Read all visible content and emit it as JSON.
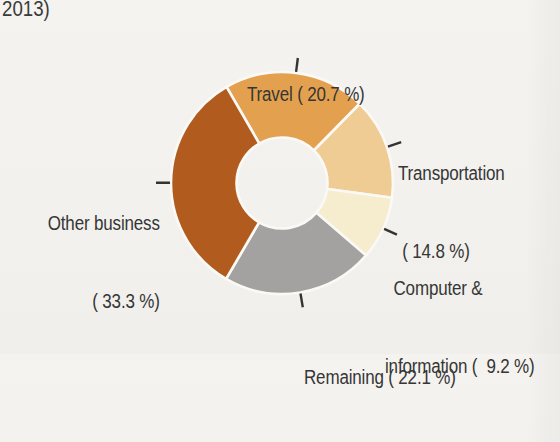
{
  "caption_fragment": "2013)",
  "palette": {
    "paper": "#f2f1ed",
    "text": "#363636",
    "separator": "#faf9f5",
    "tick": "#333333"
  },
  "chart_data": {
    "type": "pie",
    "subtype": "donut",
    "title": "",
    "unit": "%",
    "start_angle_deg": -30,
    "direction": "clockwise",
    "legend": "none",
    "separator_color": "#faf9f5",
    "tick_color": "#333333",
    "slices": [
      {
        "name": "Travel",
        "value": 20.7,
        "color": "#e3a14f",
        "label_lines": [
          "Travel ( 20.7 %)"
        ]
      },
      {
        "name": "Transportation",
        "value": 14.8,
        "color": "#f0cc95",
        "label_lines": [
          "Transportation",
          "( 14.8 %)"
        ]
      },
      {
        "name": "Computer & information",
        "value": 9.2,
        "color": "#f6ecce",
        "label_lines": [
          "Computer &",
          "information (  9.2 %)"
        ]
      },
      {
        "name": "Remaining",
        "value": 22.1,
        "color": "#a3a2a0",
        "label_lines": [
          "Remaining ( 22.1 %)"
        ]
      },
      {
        "name": "Other business",
        "value": 33.3,
        "color": "#b15c1e",
        "label_lines": [
          "Other business",
          "( 33.3 %)"
        ]
      }
    ]
  }
}
